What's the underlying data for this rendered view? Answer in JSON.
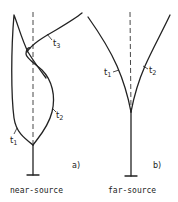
{
  "figure": {
    "panel_a": {
      "tag": "a)",
      "caption": "near-source",
      "curves": [
        {
          "label": "t1",
          "sub": "1"
        },
        {
          "label": "t2",
          "sub": "2"
        },
        {
          "label": "t3",
          "sub": "3"
        }
      ]
    },
    "panel_b": {
      "tag": "b)",
      "caption": "far-source",
      "curves": [
        {
          "label": "t1",
          "sub": "1"
        },
        {
          "label": "t2",
          "sub": "2"
        }
      ]
    }
  },
  "labels": {
    "a_t1": "t",
    "a_t1_sub": "1",
    "a_t2": "t",
    "a_t2_sub": "2",
    "a_t3": "t",
    "a_t3_sub": "3",
    "b_t1": "t",
    "b_t1_sub": "1",
    "b_t2": "t",
    "b_t2_sub": "2",
    "a_tag": "a)",
    "b_tag": "b)",
    "a_caption": "near-source",
    "b_caption": "far-source"
  }
}
